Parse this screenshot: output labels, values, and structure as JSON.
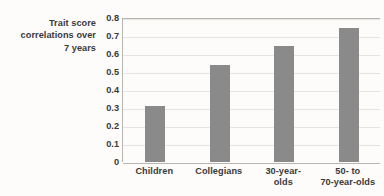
{
  "chart_data": {
    "type": "bar",
    "title": "",
    "xlabel": "",
    "ylabel": "Trait score correlations over 7 years",
    "ylabel_lines": [
      "Trait score",
      "correlations over",
      "7 years"
    ],
    "categories": [
      "Children",
      "Collegians",
      "30-year-olds",
      "50- to 70-year-olds"
    ],
    "category_lines": [
      [
        "Children"
      ],
      [
        "Collegians"
      ],
      [
        "30-year-",
        "olds"
      ],
      [
        "50- to",
        "70-year-olds"
      ]
    ],
    "values": [
      0.31,
      0.54,
      0.645,
      0.745
    ],
    "ylim": [
      0,
      0.8
    ],
    "ytick_values": [
      0.8,
      0.7,
      0.6,
      0.5,
      0.4,
      0.3,
      0.2,
      0.1,
      0
    ],
    "ytick_labels": [
      "0.8",
      "0.7",
      "0.6",
      "0.5",
      "0.4",
      "0.3",
      "0.2",
      "0.1",
      "0"
    ],
    "grid": true,
    "legend": false,
    "legend_position": "none",
    "colors": {
      "bar": "#8a8a8a",
      "gridline": "#e6e4e1",
      "axis": "#b9b6b2",
      "text": "#3a3a3a",
      "background": "#fdfcfb"
    }
  }
}
